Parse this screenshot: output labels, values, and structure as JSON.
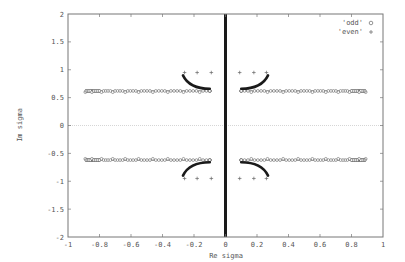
{
  "chart_data": {
    "type": "scatter",
    "title": "",
    "xlabel": "Re sigma",
    "ylabel": "Im sigma",
    "xlim": [
      -1,
      1
    ],
    "ylim": [
      -2,
      2
    ],
    "xticks": [
      "-1",
      "-0.8",
      "-0.6",
      "-0.4",
      "-0.2",
      "0",
      "0.2",
      "0.4",
      "0.6",
      "0.8",
      "1"
    ],
    "yticks": [
      "-2",
      "-1.5",
      "-1",
      "-0.5",
      "0",
      "0.5",
      "1",
      "1.5",
      "2"
    ],
    "grid": false,
    "zero_line": true,
    "legend_position": "top-right",
    "series": [
      {
        "name": "'odd'",
        "marker": "circle",
        "description": "dense horizontal bands at Im=+/-0.62 spanning Re from about -0.89 to -0.1 and 0.1 to 0.89; curved arcs from (+/-0.1, +/-0.66) to (+/-0.27, +/-0.9); dense vertical line at Re=0 over full Im range",
        "bands": [
          {
            "re_start": -0.89,
            "re_end": -0.1,
            "im": 0.62
          },
          {
            "re_start": 0.1,
            "re_end": 0.89,
            "im": 0.62
          },
          {
            "re_start": -0.89,
            "re_end": -0.1,
            "im": -0.62
          },
          {
            "re_start": 0.1,
            "re_end": 0.89,
            "im": -0.62
          }
        ],
        "arcs": [
          {
            "from": [
              -0.1,
              0.66
            ],
            "to": [
              -0.27,
              0.9
            ]
          },
          {
            "from": [
              0.1,
              0.66
            ],
            "to": [
              0.27,
              0.9
            ]
          },
          {
            "from": [
              -0.1,
              -0.66
            ],
            "to": [
              -0.27,
              -0.9
            ]
          },
          {
            "from": [
              0.1,
              -0.66
            ],
            "to": [
              0.27,
              -0.9
            ]
          }
        ],
        "vertical_line": {
          "re": 0,
          "im_start": -2,
          "im_end": 2
        }
      },
      {
        "name": "'even'",
        "marker": "plus",
        "points": [
          [
            -0.26,
            0.95
          ],
          [
            -0.18,
            0.95
          ],
          [
            -0.09,
            0.95
          ],
          [
            0.09,
            0.95
          ],
          [
            0.18,
            0.95
          ],
          [
            0.26,
            0.95
          ],
          [
            -0.26,
            -0.95
          ],
          [
            -0.18,
            -0.95
          ],
          [
            -0.09,
            -0.95
          ],
          [
            0.09,
            -0.95
          ],
          [
            0.18,
            -0.95
          ],
          [
            0.26,
            -0.95
          ]
        ]
      }
    ]
  },
  "colors": {
    "axis": "#777777",
    "data": "#1a1a1a",
    "marker_open": "#666666",
    "zero_line": "#bbbbbb"
  }
}
